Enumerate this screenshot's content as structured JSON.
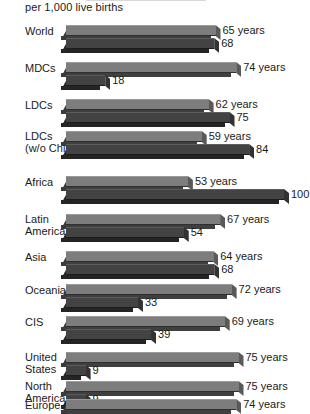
{
  "header": {
    "subtitle": "per 1,000 live births"
  },
  "chart_data": {
    "type": "bar",
    "orientation": "horizontal",
    "title": "",
    "subtitle": "per 1,000 live births",
    "xlabel": "",
    "ylabel": "",
    "grid": false,
    "legend_position": "none",
    "categories": [
      "World",
      "MDCs",
      "LDCs",
      "LDCs (w/o China)",
      "Africa",
      "Latin America",
      "Asia",
      "Oceania",
      "CIS",
      "United States",
      "North America",
      "Europe"
    ],
    "series": [
      {
        "name": "Life expectancy",
        "unit": "years",
        "values": [
          65,
          74,
          62,
          59,
          53,
          67,
          64,
          72,
          69,
          75,
          75,
          74
        ]
      },
      {
        "name": "Infant mortality",
        "unit": "per 1,000 live births",
        "values": [
          68,
          18,
          75,
          84,
          100,
          54,
          68,
          33,
          39,
          9,
          9,
          null
        ]
      }
    ]
  },
  "rows": [
    {
      "label_line1": "World",
      "label_line2": "",
      "years_value": "65 years",
      "mortality_value": "68",
      "years_num": 65,
      "mortality_num": 68
    },
    {
      "label_line1": "MDCs",
      "label_line2": "",
      "years_value": "74 years",
      "mortality_value": "18",
      "years_num": 74,
      "mortality_num": 18
    },
    {
      "label_line1": "LDCs",
      "label_line2": "",
      "years_value": "62 years",
      "mortality_value": "75",
      "years_num": 62,
      "mortality_num": 75
    },
    {
      "label_line1": "LDCs",
      "label_line2": "(w/o China)",
      "years_value": "59 years",
      "mortality_value": "84",
      "years_num": 59,
      "mortality_num": 84
    },
    {
      "label_line1": "Africa",
      "label_line2": "",
      "years_value": "53 years",
      "mortality_value": "100",
      "years_num": 53,
      "mortality_num": 100
    },
    {
      "label_line1": "Latin",
      "label_line2": "America",
      "years_value": "67 years",
      "mortality_value": "54",
      "years_num": 67,
      "mortality_num": 54
    },
    {
      "label_line1": "Asia",
      "label_line2": "",
      "years_value": "64 years",
      "mortality_value": "68",
      "years_num": 64,
      "mortality_num": 68
    },
    {
      "label_line1": "Oceania",
      "label_line2": "",
      "years_value": "72 years",
      "mortality_value": "33",
      "years_num": 72,
      "mortality_num": 33
    },
    {
      "label_line1": "CIS",
      "label_line2": "",
      "years_value": "69 years",
      "mortality_value": "39",
      "years_num": 69,
      "mortality_num": 39
    },
    {
      "label_line1": "United",
      "label_line2": "States",
      "years_value": "75 years",
      "mortality_value": "9",
      "years_num": 75,
      "mortality_num": 9
    },
    {
      "label_line1": "North",
      "label_line2": "America",
      "years_value": "75 years",
      "mortality_value": "9",
      "years_num": 75,
      "mortality_num": 9
    },
    {
      "label_line1": "Europe",
      "label_line2": "",
      "years_value": "74 years",
      "mortality_value": "",
      "years_num": 74,
      "mortality_num": null
    }
  ],
  "colors": {
    "life_expectancy_bar": "#7d7d7d",
    "infant_mortality_bar": "#434343",
    "text": "#1a1a1a",
    "background": "#ffffff"
  }
}
